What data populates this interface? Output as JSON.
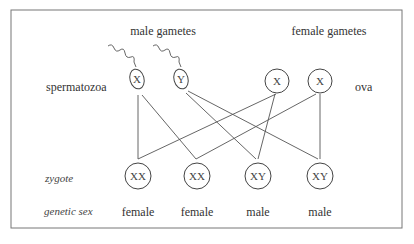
{
  "headers": {
    "male": "male gametes",
    "female": "female gametes"
  },
  "row_labels": {
    "spermatozoa": "spermatozoa",
    "ova": "ova",
    "zygote": "zygote",
    "genetic_sex": "genetic sex"
  },
  "sperm": [
    {
      "chromosome": "X"
    },
    {
      "chromosome": "Y"
    }
  ],
  "ova": [
    {
      "chromosome": "X"
    },
    {
      "chromosome": "X"
    }
  ],
  "zygotes": [
    {
      "genotype": "XX",
      "sex": "female"
    },
    {
      "genotype": "XX",
      "sex": "female"
    },
    {
      "genotype": "XY",
      "sex": "male"
    },
    {
      "genotype": "XY",
      "sex": "male"
    }
  ],
  "connections": [
    {
      "from": "sperm-X",
      "to": "zygote-1"
    },
    {
      "from": "sperm-X",
      "to": "zygote-2"
    },
    {
      "from": "sperm-Y",
      "to": "zygote-3"
    },
    {
      "from": "sperm-Y",
      "to": "zygote-4"
    },
    {
      "from": "ovum-1",
      "to": "zygote-1"
    },
    {
      "from": "ovum-1",
      "to": "zygote-3"
    },
    {
      "from": "ovum-2",
      "to": "zygote-2"
    },
    {
      "from": "ovum-2",
      "to": "zygote-4"
    }
  ]
}
